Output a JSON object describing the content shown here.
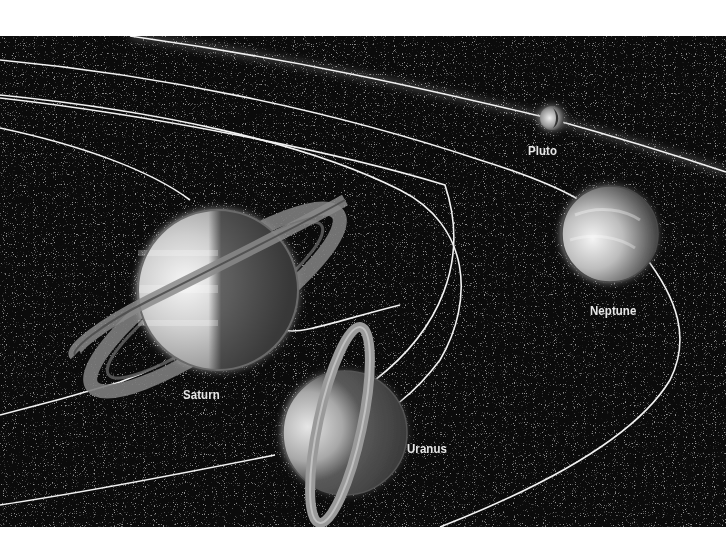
{
  "illustration": {
    "subject": "Outer planets of the solar system with orbits",
    "colors": {
      "background": "#ffffff",
      "space": "#0b0b0b",
      "orbit": "#f2f2f2",
      "label": "#e8e8e8"
    },
    "planets": [
      {
        "name": "Pluto",
        "label": "Pluto"
      },
      {
        "name": "Neptune",
        "label": "Neptune"
      },
      {
        "name": "Saturn",
        "label": "Saturn"
      },
      {
        "name": "Uranus",
        "label": "Uranus"
      }
    ]
  }
}
